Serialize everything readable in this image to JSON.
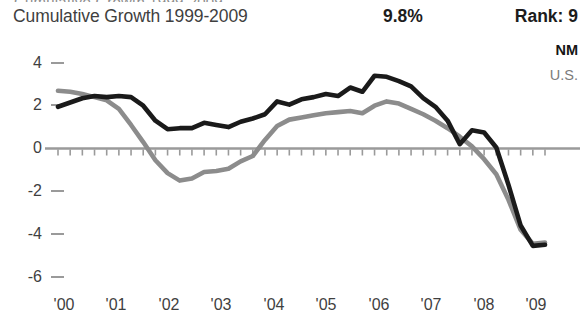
{
  "header": {
    "clipped_top_text": "Cumulative Growth 1999-2009",
    "title": "Cumulative Growth 1999-2009",
    "stat_value": "9.8%",
    "stat_rank": "Rank: 9"
  },
  "legend": {
    "items": [
      {
        "label": "NM",
        "color": "#1a1a1a"
      },
      {
        "label": "U.S.",
        "color": "#8c8c8c"
      }
    ]
  },
  "colors": {
    "nm_line": "#1a1a1a",
    "us_line": "#8c8c8c",
    "axis": "#9a9a9a",
    "text": "#3f3f3f",
    "title": "#3f3f3f",
    "bold_text": "#1c1c1c",
    "background": "#ffffff"
  },
  "chart_data": {
    "type": "line",
    "title": "Cumulative Growth 1999-2009",
    "xlabel": "",
    "ylabel": "",
    "ylim": [
      -6,
      4
    ],
    "yticks": [
      4,
      2,
      0,
      -2,
      -4,
      -6
    ],
    "ytick_labels": [
      "4",
      "2",
      "0",
      "-2",
      "-4",
      "-6"
    ],
    "xticks": [
      "'00",
      "'01",
      "'02",
      "'03",
      "'04",
      "'05",
      "'06",
      "'07",
      "'08",
      "'09"
    ],
    "x_start": 1999.5,
    "x_end": 2009.5,
    "x_step": 0.25,
    "grid": false,
    "legend_position": "top-right",
    "zero_line": true,
    "minor_tick_interval": 0.25,
    "annotations": [
      {
        "text": "9.8%",
        "role": "cumulative-growth-value"
      },
      {
        "text": "Rank: 9",
        "role": "state-rank"
      }
    ],
    "series": [
      {
        "name": "NM",
        "color": "#1a1a1a",
        "x": [
          1999.5,
          1999.75,
          2000.0,
          2000.25,
          2000.5,
          2000.75,
          2001.0,
          2001.25,
          2001.5,
          2001.75,
          2002.0,
          2002.25,
          2002.5,
          2002.75,
          2003.0,
          2003.25,
          2003.5,
          2003.75,
          2004.0,
          2004.25,
          2004.5,
          2004.75,
          2005.0,
          2005.25,
          2005.5,
          2005.75,
          2006.0,
          2006.25,
          2006.5,
          2006.75,
          2007.0,
          2007.25,
          2007.5,
          2007.75,
          2008.0,
          2008.25,
          2008.5,
          2008.75,
          2009.0,
          2009.25,
          2009.5
        ],
        "values": [
          1.95,
          2.15,
          2.35,
          2.45,
          2.4,
          2.45,
          2.4,
          2.0,
          1.3,
          0.9,
          0.95,
          0.95,
          1.2,
          1.1,
          1.0,
          1.25,
          1.4,
          1.6,
          2.2,
          2.05,
          2.3,
          2.4,
          2.55,
          2.45,
          2.85,
          2.65,
          3.4,
          3.35,
          3.15,
          2.9,
          2.35,
          1.95,
          1.3,
          0.2,
          0.85,
          0.75,
          0.05,
          -1.7,
          -3.6,
          -4.55,
          -4.5
        ]
      },
      {
        "name": "U.S.",
        "color": "#8c8c8c",
        "x": [
          1999.5,
          1999.75,
          2000.0,
          2000.25,
          2000.5,
          2000.75,
          2001.0,
          2001.25,
          2001.5,
          2001.75,
          2002.0,
          2002.25,
          2002.5,
          2002.75,
          2003.0,
          2003.25,
          2003.5,
          2003.75,
          2004.0,
          2004.25,
          2004.5,
          2004.75,
          2005.0,
          2005.25,
          2005.5,
          2005.75,
          2006.0,
          2006.25,
          2006.5,
          2006.75,
          2007.0,
          2007.25,
          2007.5,
          2007.75,
          2008.0,
          2008.25,
          2008.5,
          2008.75,
          2009.0,
          2009.25,
          2009.5
        ],
        "values": [
          2.7,
          2.65,
          2.55,
          2.4,
          2.25,
          1.85,
          1.1,
          0.3,
          -0.55,
          -1.15,
          -1.5,
          -1.4,
          -1.1,
          -1.05,
          -0.95,
          -0.6,
          -0.35,
          0.4,
          1.05,
          1.35,
          1.45,
          1.55,
          1.65,
          1.7,
          1.75,
          1.65,
          2.0,
          2.2,
          2.1,
          1.85,
          1.6,
          1.3,
          0.95,
          0.55,
          0.1,
          -0.5,
          -1.2,
          -2.4,
          -3.8,
          -4.45,
          -4.4
        ]
      }
    ]
  }
}
